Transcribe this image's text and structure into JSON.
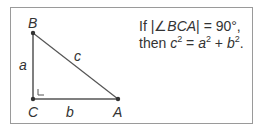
{
  "diagram": {
    "type": "right-triangle",
    "vertices": {
      "B": {
        "label": "B"
      },
      "C": {
        "label": "C"
      },
      "A": {
        "label": "A"
      }
    },
    "sides": {
      "a": {
        "label": "a",
        "between": [
          "B",
          "C"
        ]
      },
      "b": {
        "label": "b",
        "between": [
          "C",
          "A"
        ]
      },
      "c": {
        "label": "c",
        "between": [
          "B",
          "A"
        ]
      }
    },
    "right_angle_at": "C"
  },
  "statement": {
    "line1_prefix": "If |∠",
    "line1_angle": "BCA",
    "line1_suffix": "| = 90°,",
    "line2_prefix": "then ",
    "c": "c",
    "eq": " = ",
    "a": "a",
    "plus": " + ",
    "b": "b",
    "exp": "2",
    "end": "."
  },
  "colors": {
    "line": "#555555",
    "text": "#333333",
    "border": "#9a9a9a"
  }
}
